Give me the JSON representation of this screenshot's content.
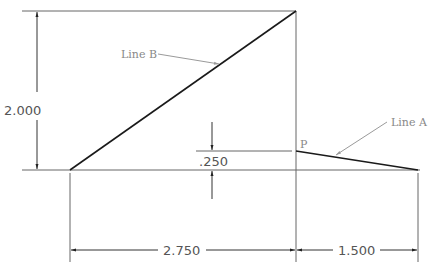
{
  "diagram": {
    "colors": {
      "object_line": "#1a1a1a",
      "dimension_line": "#555555",
      "leader": "#9a9a9a",
      "text": "#555555",
      "label_text": "#888888",
      "background": "#ffffff"
    },
    "dimensions": {
      "height": "2.000",
      "rise": ".250",
      "left_span": "2.750",
      "right_span": "1.500"
    },
    "labels": {
      "line_a": "Line A",
      "line_b": "Line B",
      "point_p": "P"
    }
  }
}
